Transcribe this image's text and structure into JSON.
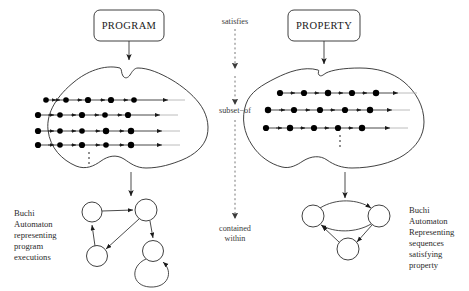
{
  "diagram": {
    "title_boxes": {
      "program": "PROGRAM",
      "property": "PROPERTY"
    },
    "middle_labels": {
      "satisfies": "satisfies",
      "subset_of": "subset−of",
      "contained": "contained",
      "within": "within"
    },
    "left_caption": {
      "line1": "Buchi",
      "line2": "Automaton",
      "line3": "representing",
      "line4": "program",
      "line5": "executions"
    },
    "right_caption": {
      "line1": "Buchi",
      "line2": "Automaton",
      "line3": "Representing",
      "line4": "sequences",
      "line5": "satisfying",
      "line6": "property"
    },
    "colors": {
      "ink": "#2b2b2b",
      "dot": "#000000",
      "dashed": "#6a6a6a",
      "fade": "#b4b4b4",
      "background": "#ffffff"
    },
    "left_blob": {
      "name": "program-executions-set",
      "sequence_count": 4,
      "sequences": [
        {
          "y": 100,
          "x_start": 46,
          "x_end": 168,
          "dots": [
            46,
            66,
            88,
            111,
            134
          ],
          "tail_to": 185
        },
        {
          "y": 115,
          "x_start": 38,
          "x_end": 160,
          "dots": [
            38,
            60,
            82,
            105,
            128
          ],
          "tail_to": 178
        },
        {
          "y": 131,
          "x_start": 38,
          "x_end": 162,
          "dots": [
            38,
            60,
            82,
            106,
            131
          ],
          "tail_to": 180
        },
        {
          "y": 145,
          "x_start": 38,
          "x_end": 162,
          "dots": [
            38,
            60,
            82,
            106,
            131
          ],
          "tail_to": 180
        }
      ],
      "ellipsis_x": 89,
      "ellipsis_ys": [
        153,
        158,
        163
      ]
    },
    "right_blob": {
      "name": "property-sequences-set",
      "sequence_count": 3,
      "sequences": [
        {
          "y": 93,
          "x_start": 280,
          "x_end": 398,
          "dots": [
            280,
            304,
            328,
            352,
            376
          ],
          "tail_to": 417
        },
        {
          "y": 110,
          "x_start": 268,
          "x_end": 392,
          "dots": [
            268,
            294,
            320,
            345,
            370
          ],
          "tail_to": 410
        },
        {
          "y": 128,
          "x_start": 266,
          "x_end": 390,
          "dots": [
            266,
            290,
            314,
            338,
            362
          ],
          "tail_to": 408
        }
      ],
      "ellipsis_x": 340,
      "ellipsis_ys": [
        136,
        141,
        146
      ]
    },
    "left_automaton": {
      "name": "buchi-automaton-program",
      "state_count": 4,
      "states": [
        {
          "id": "q0",
          "cx": 92,
          "cy": 212,
          "r": 10
        },
        {
          "id": "q1",
          "cx": 146,
          "cy": 210,
          "r": 11
        },
        {
          "id": "q2",
          "cx": 97,
          "cy": 256,
          "r": 10.5
        },
        {
          "id": "q3",
          "cx": 153,
          "cy": 251,
          "r": 10.5
        }
      ],
      "has_self_loop": true
    },
    "right_automaton": {
      "name": "buchi-automaton-property",
      "state_count": 3,
      "states": [
        {
          "id": "p0",
          "cx": 313,
          "cy": 216,
          "r": 11
        },
        {
          "id": "p1",
          "cx": 379,
          "cy": 216,
          "r": 11
        },
        {
          "id": "p2",
          "cx": 348,
          "cy": 249,
          "r": 11
        }
      ],
      "has_self_loop": false
    }
  }
}
